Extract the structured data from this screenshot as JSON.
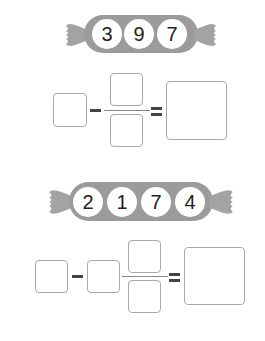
{
  "problems": [
    {
      "candy_digits": [
        "3",
        "9",
        "7"
      ],
      "equation": "box − box/box = box",
      "colors": {
        "candy": "#9b9b9b",
        "box_border": "#a8a8a8"
      }
    },
    {
      "candy_digits": [
        "2",
        "1",
        "7",
        "4"
      ],
      "equation": "box − box box/box = box",
      "colors": {
        "candy": "#9b9b9b",
        "box_border": "#a8a8a8"
      }
    }
  ]
}
